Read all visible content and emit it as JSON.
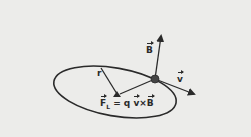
{
  "diagram": {
    "labels": {
      "radius": "r",
      "magnetic_field": "B",
      "velocity": "v",
      "force_lhs": "F",
      "force_sub": "L",
      "force_eq": "= q",
      "force_v": "v",
      "force_cross": "×",
      "force_b": "B"
    },
    "colors": {
      "background": "#ececea",
      "ink": "#2a2a2a"
    }
  }
}
